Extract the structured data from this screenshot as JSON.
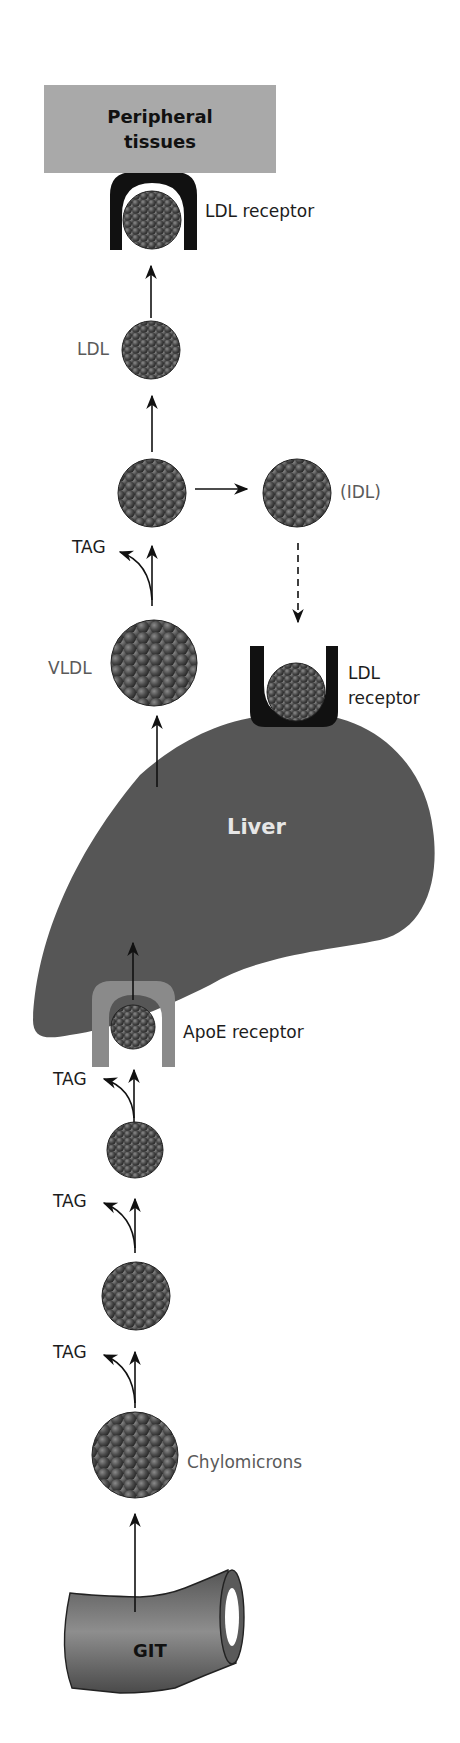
{
  "figure": {
    "nodes": {
      "peripheral_tissues": {
        "line1": "Peripheral",
        "line2": "tissues"
      },
      "ldl_receptor_peripheral": "LDL receptor",
      "ldl": "LDL",
      "idl": "(IDL)",
      "vldl": "VLDL",
      "ldl_receptor_liver": {
        "line1": "LDL",
        "line2": "receptor"
      },
      "liver": "Liver",
      "apoe_receptor": "ApoE receptor",
      "chylomicrons": "Chylomicrons",
      "git": "GIT"
    },
    "tag_labels": [
      "TAG",
      "TAG",
      "TAG",
      "TAG"
    ],
    "colors": {
      "particle": "#4a4a4a",
      "liver": "#565656",
      "receptor_ldl": "#111111",
      "receptor_apoe": "#8a8a8a",
      "peripheral_box": "#a9a9a9",
      "label_gray": "#5a5a5a"
    }
  }
}
